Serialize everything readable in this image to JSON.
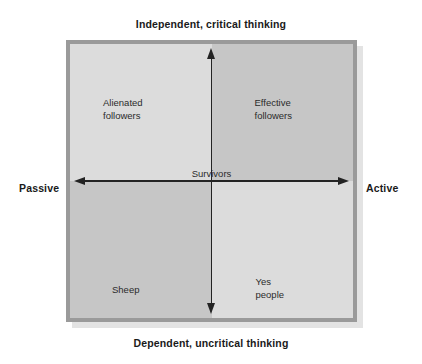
{
  "figure": {
    "type": "2x2-matrix-diagram",
    "axes": {
      "vertical": {
        "top_label": "Independent, critical thinking",
        "bottom_label": "Dependent, uncritical thinking"
      },
      "horizontal": {
        "left_label": "Passive",
        "right_label": "Active"
      }
    },
    "center_label": "Survivors",
    "quadrants": [
      {
        "id": "top-left",
        "label": "Alienated\nfollowers",
        "fill": "#dcdcdc"
      },
      {
        "id": "top-right",
        "label": "Effective\nfollowers",
        "fill": "#c6c6c6"
      },
      {
        "id": "bottom-left",
        "label": "Sheep",
        "fill": "#c6c6c6"
      },
      {
        "id": "bottom-right",
        "label": "Yes\npeople",
        "fill": "#dcdcdc"
      }
    ],
    "colors": {
      "frame_border": "#9a9a9a",
      "axis_line": "#232323",
      "caption_text": "#1a1a1a",
      "quadrant_text": "#2b2b2b",
      "background": "#ffffff"
    }
  }
}
